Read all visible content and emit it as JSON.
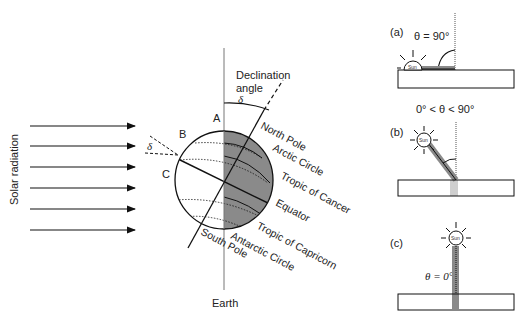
{
  "figure": {
    "left_panel": {
      "solar_radiation_label": "Solar radiation",
      "arrow_count": 6,
      "declination_label_line1": "Declination",
      "declination_label_line2": "angle",
      "delta_symbol": "δ",
      "delta_symbol_left": "δ",
      "point_labels": {
        "a": "A",
        "b": "B",
        "c": "C"
      },
      "earth_label": "Earth",
      "globe_labels": {
        "north_pole": "North Pole",
        "arctic_circle": "Arctic Circle",
        "tropic_cancer": "Tropic of Cancer",
        "equator": "Equator",
        "tropic_capricorn": "Tropic of Capricorn",
        "antarctic_circle": "Antarctic Circle",
        "south_pole": "South Pole"
      },
      "colors": {
        "night_side": "#8a8a8a",
        "day_side": "#ffffff",
        "line": "#111111"
      }
    },
    "right_panels": {
      "a": {
        "tag": "(a)",
        "angle_label": "θ = 90°",
        "sun_label": "Sun"
      },
      "b": {
        "tag": "(b)",
        "angle_label": "0° < θ < 90°",
        "sun_label": "Sun"
      },
      "c": {
        "tag": "(c)",
        "angle_label": "θ = 0°",
        "sun_label": "Sun"
      },
      "colors": {
        "beam": "#8a8a8a",
        "beam_light": "#cfcfcf"
      }
    }
  }
}
